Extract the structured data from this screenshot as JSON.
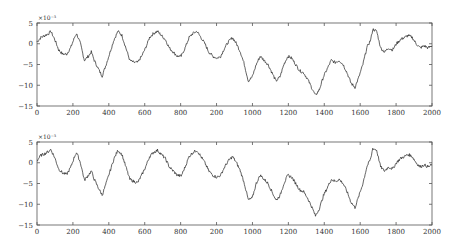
{
  "chart_data": [
    {
      "type": "line",
      "title": "",
      "xlabel": "",
      "ylabel": "",
      "y_exponent_label": "×10⁻³",
      "xlim": [
        0,
        2000
      ],
      "ylim": [
        -15,
        5
      ],
      "grid": false,
      "legend": null,
      "x_ticks": [
        0,
        200,
        400,
        600,
        800,
        1000,
        1200,
        1400,
        1600,
        1800,
        2000
      ],
      "x_tick_labels": [
        "0",
        "200",
        "400",
        "600",
        "800",
        "200",
        "1000",
        "1200",
        "1400",
        "1600",
        "1800",
        "2000"
      ],
      "y_ticks": [
        5,
        0,
        -5,
        -10,
        -15
      ],
      "y_tick_labels": [
        "5",
        "0",
        "−5",
        "−10",
        "−15"
      ],
      "series": [
        {
          "name": "signal",
          "x": [
            0,
            20,
            40,
            60,
            70,
            90,
            110,
            130,
            150,
            170,
            190,
            200,
            220,
            240,
            260,
            275,
            290,
            310,
            330,
            350,
            370,
            390,
            410,
            430,
            450,
            470,
            490,
            510,
            530,
            550,
            570,
            590,
            610,
            630,
            650,
            670,
            690,
            710,
            730,
            750,
            770,
            790,
            810,
            830,
            850,
            870,
            890,
            910,
            930,
            950,
            970,
            990,
            1010,
            1030,
            1050,
            1070,
            1090,
            1110,
            1130,
            1150,
            1170,
            1190,
            1210,
            1230,
            1250,
            1270,
            1290,
            1310,
            1330,
            1350,
            1370,
            1390,
            1410,
            1430,
            1450,
            1470,
            1490,
            1510,
            1530,
            1550,
            1570,
            1590,
            1610,
            1630,
            1650,
            1670,
            1690,
            1700,
            1720,
            1740,
            1760,
            1780,
            1800,
            1820,
            1840,
            1860,
            1880,
            1900,
            1920,
            1940,
            1960,
            1980,
            2000
          ],
          "values": [
            0.5,
            1.5,
            2,
            2.5,
            3,
            1,
            -1.5,
            -2.5,
            -2.5,
            -1,
            1.5,
            2.5,
            0,
            -4,
            -3,
            -2,
            -4,
            -6,
            -7.8,
            -5,
            -2,
            1,
            3,
            2,
            -1,
            -4,
            -4.5,
            -4.5,
            -3,
            -1,
            1.5,
            2.5,
            3,
            2,
            1,
            -1,
            -2,
            -3,
            -3,
            -1,
            1.5,
            2.5,
            3,
            1.5,
            0,
            -2,
            -3,
            -3.5,
            -3,
            -1,
            0.5,
            1.5,
            0,
            -2,
            -5,
            -9,
            -8,
            -5,
            -3,
            -4,
            -5,
            -7,
            -9,
            -8,
            -5,
            -3,
            -3.5,
            -5,
            -6.5,
            -7,
            -8.5,
            -10.5,
            -12.5,
            -11,
            -8,
            -6,
            -4,
            -4.5,
            -4,
            -5,
            -7,
            -9.5,
            -10.5,
            -8,
            -5,
            -1,
            1,
            3.5,
            3,
            -1,
            -2,
            -1,
            -1.5,
            0,
            1,
            1.5,
            2,
            1.5,
            0,
            -1,
            -0.5,
            -1,
            -0.5
          ]
        }
      ]
    },
    {
      "type": "line",
      "title": "",
      "xlabel": "",
      "ylabel": "",
      "y_exponent_label": "×10⁻³",
      "xlim": [
        0,
        2000
      ],
      "ylim": [
        -15,
        5
      ],
      "grid": false,
      "legend": null,
      "x_ticks": [
        0,
        200,
        400,
        600,
        800,
        1000,
        1200,
        1400,
        1600,
        1800,
        2000
      ],
      "x_tick_labels": [
        "0",
        "200",
        "400",
        "600",
        "800",
        "200",
        "1000",
        "1200",
        "1400",
        "1600",
        "1800",
        "2000"
      ],
      "y_ticks": [
        5,
        0,
        -5,
        -10,
        -15
      ],
      "y_tick_labels": [
        "5",
        "0",
        "−5",
        "−10",
        "−15"
      ],
      "series": [
        {
          "name": "signal",
          "x": [
            0,
            20,
            40,
            60,
            70,
            90,
            110,
            130,
            150,
            170,
            190,
            200,
            220,
            240,
            260,
            275,
            290,
            310,
            330,
            350,
            370,
            390,
            410,
            430,
            450,
            470,
            490,
            510,
            530,
            550,
            570,
            590,
            610,
            630,
            650,
            670,
            690,
            710,
            730,
            750,
            770,
            790,
            810,
            830,
            850,
            870,
            890,
            910,
            930,
            950,
            970,
            990,
            1010,
            1030,
            1050,
            1070,
            1090,
            1110,
            1130,
            1150,
            1170,
            1190,
            1210,
            1230,
            1250,
            1270,
            1290,
            1310,
            1330,
            1350,
            1370,
            1390,
            1410,
            1430,
            1450,
            1470,
            1490,
            1510,
            1530,
            1550,
            1570,
            1590,
            1610,
            1630,
            1650,
            1670,
            1690,
            1700,
            1720,
            1740,
            1760,
            1780,
            1800,
            1820,
            1840,
            1860,
            1880,
            1900,
            1920,
            1940,
            1960,
            1980,
            2000
          ],
          "values": [
            0.5,
            1.8,
            2.2,
            2.8,
            3.2,
            1.2,
            -1.5,
            -2.5,
            -2.8,
            -1.2,
            1.5,
            2.5,
            0,
            -4.2,
            -3,
            -2,
            -4,
            -6,
            -7.8,
            -5,
            -2,
            1,
            3,
            2,
            -1,
            -4,
            -4.5,
            -4.8,
            -3,
            -1,
            1.5,
            2.5,
            3,
            2,
            1,
            -1,
            -2,
            -3,
            -3.2,
            -1,
            1.5,
            2.5,
            3,
            1.5,
            0,
            -2,
            -3,
            -3.5,
            -3,
            -1,
            0.5,
            1.5,
            0,
            -2,
            -5,
            -9,
            -8.5,
            -5,
            -3,
            -4,
            -5,
            -7,
            -9,
            -8,
            -5,
            -3,
            -3.5,
            -5,
            -6.5,
            -7,
            -8.5,
            -10.5,
            -12.8,
            -11,
            -8,
            -6,
            -4,
            -4.5,
            -4,
            -5,
            -7,
            -9.5,
            -10.8,
            -8,
            -5,
            -1,
            1,
            3.5,
            3,
            -1,
            -2,
            -1,
            -1.5,
            0,
            1,
            1.5,
            2,
            1.5,
            0,
            -1,
            -0.5,
            -1,
            -0.5
          ]
        }
      ]
    }
  ]
}
